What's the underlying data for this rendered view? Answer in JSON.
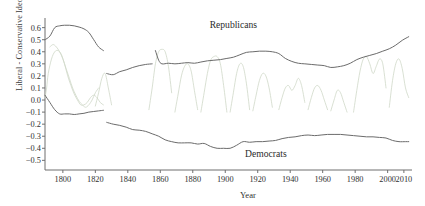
{
  "chart_data": {
    "type": "line",
    "title": "",
    "xlabel": "Year",
    "ylabel": "Liberal - Conservative Ideology",
    "xlim": [
      1789,
      2015
    ],
    "ylim": [
      -0.58,
      0.68
    ],
    "grid": false,
    "legend_position": "inline-annotations",
    "xticks": [
      1800,
      1820,
      1840,
      1860,
      1880,
      1900,
      1920,
      1940,
      1960,
      1980,
      2000,
      2010
    ],
    "xtick_labels": [
      "1800",
      "1820",
      "1840",
      "1860",
      "1880",
      "1900",
      "1920",
      "1940",
      "1960",
      "1980",
      "2000",
      "2010"
    ],
    "yticks": [
      0.6,
      0.5,
      0.4,
      0.3,
      0.2,
      0.1,
      0.0,
      -0.1,
      -0.2,
      -0.3,
      -0.4,
      -0.5
    ],
    "ytick_labels": [
      "0.6",
      "0.5",
      "0.4",
      "0.3",
      "0.2",
      "0.1",
      "0.0",
      "-0.1",
      "-0.2",
      "-0.3",
      "-0.4",
      "-0.5"
    ],
    "annotations": [
      {
        "text": "Republicans",
        "x": 1905,
        "y": 0.6
      },
      {
        "text": "Democrats",
        "x": 1925,
        "y": -0.47
      }
    ],
    "series": [
      {
        "name": "Republicans",
        "color": "#6b6b6b",
        "linewidth": 1.0,
        "segments": [
          {
            "label": "Federalists",
            "x": [
              1789,
              1792,
              1795,
              1798,
              1801,
              1804,
              1807,
              1810,
              1813,
              1816,
              1819,
              1822,
              1825
            ],
            "y": [
              0.5,
              0.53,
              0.6,
              0.615,
              0.62,
              0.62,
              0.615,
              0.605,
              0.59,
              0.56,
              0.5,
              0.44,
              0.41
            ]
          },
          {
            "label": "Whigs",
            "x": [
              1827,
              1831,
              1835,
              1839,
              1843,
              1847,
              1851,
              1855
            ],
            "y": [
              0.22,
              0.21,
              0.235,
              0.25,
              0.27,
              0.285,
              0.295,
              0.3
            ]
          },
          {
            "label": "Republicans",
            "x": [
              1857,
              1859,
              1861,
              1865,
              1869,
              1873,
              1877,
              1881,
              1885,
              1889,
              1893,
              1897,
              1901,
              1905,
              1909,
              1913,
              1917,
              1921,
              1925,
              1929,
              1933,
              1937,
              1941,
              1945,
              1949,
              1953,
              1957,
              1961,
              1965,
              1969,
              1973,
              1977,
              1981,
              1985,
              1989,
              1993,
              1997,
              2001,
              2005,
              2009,
              2013
            ],
            "y": [
              0.41,
              0.33,
              0.3,
              0.305,
              0.3,
              0.305,
              0.31,
              0.305,
              0.315,
              0.325,
              0.33,
              0.335,
              0.345,
              0.355,
              0.375,
              0.395,
              0.4,
              0.405,
              0.405,
              0.4,
              0.385,
              0.345,
              0.32,
              0.305,
              0.3,
              0.295,
              0.29,
              0.285,
              0.27,
              0.275,
              0.285,
              0.305,
              0.335,
              0.355,
              0.37,
              0.385,
              0.405,
              0.425,
              0.455,
              0.495,
              0.525
            ]
          }
        ]
      },
      {
        "name": "Democrats",
        "color": "#6b6b6b",
        "linewidth": 1.0,
        "segments": [
          {
            "label": "Jeffersonian Republicans",
            "x": [
              1789,
              1792,
              1795,
              1798,
              1801,
              1804,
              1807,
              1810,
              1813,
              1816,
              1819,
              1822,
              1825
            ],
            "y": [
              0.04,
              -0.02,
              -0.08,
              -0.115,
              -0.115,
              -0.115,
              -0.12,
              -0.115,
              -0.11,
              -0.1,
              -0.095,
              -0.09,
              -0.085
            ]
          },
          {
            "label": "Democrats",
            "x": [
              1827,
              1831,
              1835,
              1839,
              1843,
              1847,
              1851,
              1855,
              1859,
              1863,
              1867,
              1871,
              1875,
              1879,
              1883,
              1887,
              1891,
              1895,
              1899,
              1903,
              1907,
              1911,
              1915,
              1919,
              1923,
              1927,
              1931,
              1935,
              1939,
              1943,
              1947,
              1951,
              1955,
              1959,
              1963,
              1967,
              1971,
              1975,
              1979,
              1983,
              1987,
              1991,
              1995,
              1999,
              2003,
              2007,
              2011,
              2013
            ],
            "y": [
              -0.185,
              -0.2,
              -0.21,
              -0.225,
              -0.245,
              -0.25,
              -0.26,
              -0.28,
              -0.3,
              -0.33,
              -0.345,
              -0.355,
              -0.355,
              -0.355,
              -0.365,
              -0.36,
              -0.385,
              -0.4,
              -0.4,
              -0.4,
              -0.375,
              -0.345,
              -0.35,
              -0.345,
              -0.345,
              -0.34,
              -0.335,
              -0.32,
              -0.31,
              -0.305,
              -0.295,
              -0.29,
              -0.295,
              -0.29,
              -0.285,
              -0.285,
              -0.285,
              -0.29,
              -0.295,
              -0.3,
              -0.305,
              -0.305,
              -0.31,
              -0.315,
              -0.335,
              -0.345,
              -0.345,
              -0.345
            ]
          }
        ]
      },
      {
        "name": "third-party-and-minor-traces",
        "color": "#cfd8c8",
        "linewidth": 0.8,
        "polylines": [
          {
            "x": [
              1789,
              1790,
              1791,
              1793,
              1795,
              1797,
              1799,
              1801,
              1803,
              1805,
              1807,
              1809,
              1811,
              1813,
              1815,
              1817,
              1819,
              1821,
              1823,
              1825
            ],
            "y": [
              0.02,
              0.1,
              0.22,
              0.34,
              0.4,
              0.41,
              0.38,
              0.3,
              0.2,
              0.12,
              0.05,
              0.0,
              -0.04,
              -0.04,
              -0.02,
              0.02,
              0.04,
              0.02,
              -0.02,
              -0.04
            ]
          },
          {
            "x": [
              1792,
              1794,
              1796,
              1798,
              1800,
              1802,
              1804,
              1806,
              1808,
              1810,
              1812,
              1814,
              1816,
              1818,
              1820,
              1822
            ],
            "y": [
              0.44,
              0.46,
              0.44,
              0.4,
              0.34,
              0.26,
              0.18,
              0.1,
              0.04,
              -0.01,
              -0.04,
              -0.06,
              -0.04,
              0.0,
              0.06,
              0.1
            ]
          },
          {
            "x": [
              1820,
              1822,
              1824,
              1826,
              1828,
              1830
            ],
            "y": [
              -0.05,
              0.06,
              0.18,
              0.22,
              0.1,
              -0.04
            ]
          },
          {
            "x": [
              1853,
              1855,
              1857,
              1859,
              1861,
              1863,
              1865,
              1867
            ],
            "y": [
              -0.08,
              0.1,
              0.3,
              0.4,
              0.42,
              0.4,
              0.28,
              0.06
            ]
          },
          {
            "x": [
              1869,
              1871,
              1873,
              1875,
              1877,
              1879,
              1881,
              1883
            ],
            "y": [
              -0.1,
              0.05,
              0.2,
              0.28,
              0.3,
              0.24,
              0.08,
              -0.08
            ]
          },
          {
            "x": [
              1885,
              1887,
              1889,
              1891,
              1893,
              1895,
              1897,
              1899,
              1901
            ],
            "y": [
              -0.1,
              0.06,
              0.22,
              0.33,
              0.36,
              0.36,
              0.3,
              0.12,
              -0.1
            ]
          },
          {
            "x": [
              1903,
              1905,
              1907,
              1909,
              1911,
              1913,
              1915
            ],
            "y": [
              -0.1,
              0.06,
              0.22,
              0.3,
              0.28,
              0.14,
              -0.08
            ]
          },
          {
            "x": [
              1917,
              1919,
              1921,
              1923,
              1925,
              1927,
              1929
            ],
            "y": [
              -0.09,
              0.04,
              0.16,
              0.22,
              0.2,
              0.1,
              -0.06
            ]
          },
          {
            "x": [
              1933,
              1935,
              1937,
              1939,
              1941,
              1943,
              1945,
              1947,
              1949
            ],
            "y": [
              -0.08,
              0.02,
              0.1,
              0.12,
              0.08,
              0.12,
              0.18,
              0.12,
              -0.02
            ]
          },
          {
            "x": [
              1951,
              1953,
              1955,
              1957,
              1959,
              1961,
              1963
            ],
            "y": [
              -0.08,
              0.02,
              0.1,
              0.12,
              0.08,
              0.0,
              -0.08
            ]
          },
          {
            "x": [
              1965,
              1967,
              1969,
              1971,
              1973,
              1975
            ],
            "y": [
              -0.09,
              0.0,
              0.08,
              0.06,
              -0.02,
              -0.1
            ]
          },
          {
            "x": [
              1979,
              1981,
              1983,
              1985,
              1987,
              1989,
              1991,
              1993,
              1995,
              1997,
              1999
            ],
            "y": [
              -0.1,
              0.08,
              0.24,
              0.34,
              0.36,
              0.3,
              0.22,
              0.28,
              0.34,
              0.3,
              0.1
            ]
          },
          {
            "x": [
              2001,
              2003,
              2005,
              2007,
              2009,
              2011,
              2013
            ],
            "y": [
              -0.06,
              0.16,
              0.3,
              0.34,
              0.26,
              0.1,
              0.02
            ]
          }
        ]
      }
    ]
  },
  "axes": {
    "x_axis_name": "year-axis",
    "y_axis_name": "ideology-axis"
  }
}
